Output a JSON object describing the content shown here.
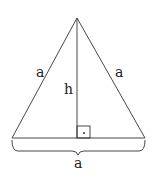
{
  "diagram": {
    "labels": {
      "left_side": "a",
      "right_side": "a",
      "height": "h",
      "base": "a",
      "right_angle_mark": "·"
    },
    "colors": {
      "stroke": "#333333",
      "background": "#ffffff"
    }
  }
}
